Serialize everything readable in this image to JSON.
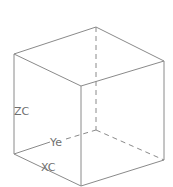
{
  "diagram": {
    "type": "wireframe-cube",
    "colors": {
      "edge": "#8a8a8a",
      "label": "#6f6f6f",
      "background": "#ffffff"
    },
    "vertices": {
      "top_back": [
        96,
        27
      ],
      "top_left": [
        14,
        54
      ],
      "top_right": [
        164,
        61
      ],
      "top_front": [
        81,
        86
      ],
      "bottom_back": [
        96,
        130
      ],
      "bottom_left": [
        14,
        154
      ],
      "bottom_right": [
        164,
        160
      ],
      "bottom_front": [
        81,
        186
      ]
    },
    "labels": {
      "z_axis": "ZC",
      "y_axis": "Ye",
      "x_axis": "XC"
    }
  }
}
